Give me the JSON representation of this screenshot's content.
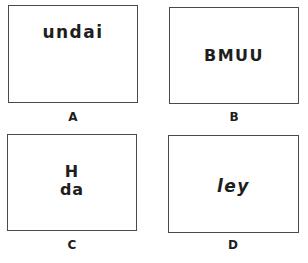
{
  "panels": [
    {
      "id": "A",
      "text": "undai",
      "caption": "A",
      "style": "bold"
    },
    {
      "id": "B",
      "text": "BMUU",
      "caption": "B",
      "style": "bold"
    },
    {
      "id": "C",
      "text": "H\nda",
      "caption": "C",
      "style": "bold"
    },
    {
      "id": "D",
      "text": "ley",
      "caption": "D",
      "style": "bold-italic"
    }
  ],
  "colors": {
    "border": "#4a4a4a",
    "text": "#1e1e1e",
    "background": "#ffffff"
  }
}
